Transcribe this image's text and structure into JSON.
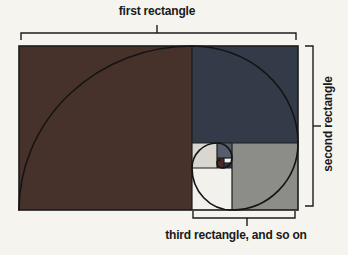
{
  "page": {
    "background": "#f5f4ef",
    "line_color": "#1c1c1c",
    "label_color": "#1a1a1a"
  },
  "labels": {
    "top": "first rectangle",
    "right": "second rectangle",
    "bottom": "third rectangle, and so on"
  },
  "figure": {
    "type": "golden-ratio-spiral-diagram",
    "outer": {
      "x": 19,
      "y": 46,
      "w": 279,
      "h": 164
    },
    "squares": [
      {
        "name": "square-1-first-maroon",
        "x": 19,
        "y": 46,
        "w": 173,
        "h": 164,
        "fill": "#47312b"
      },
      {
        "name": "square-2-second-navy",
        "x": 192,
        "y": 46,
        "w": 106,
        "h": 97,
        "fill": "#333a48"
      },
      {
        "name": "square-3-third-gray",
        "x": 232,
        "y": 143,
        "w": 66,
        "h": 67,
        "fill": "#8c8c88"
      },
      {
        "name": "square-4-white",
        "x": 192,
        "y": 168,
        "w": 40,
        "h": 42,
        "fill": "#f2f1ec"
      },
      {
        "name": "square-5-lightgray",
        "x": 192,
        "y": 143,
        "w": 25,
        "h": 25,
        "fill": "#d9d7cf"
      },
      {
        "name": "square-6-slate",
        "x": 217,
        "y": 143,
        "w": 15,
        "h": 15,
        "fill": "#565e6d"
      },
      {
        "name": "square-7-darkred",
        "x": 217,
        "y": 158,
        "w": 7,
        "h": 10,
        "fill": "#4a2a26"
      },
      {
        "name": "square-8-tiny-white",
        "x": 224,
        "y": 158,
        "w": 8,
        "h": 5,
        "fill": "#f2f1ec"
      },
      {
        "name": "square-9-tiny-navy",
        "x": 224,
        "y": 163,
        "w": 8,
        "h": 5,
        "fill": "#333a48"
      }
    ],
    "dividers": [
      "M192 46 L192 210",
      "M192 143 L298 143",
      "M232 143 L232 210",
      "M192 168 L232 168",
      "M217 143 L217 168",
      "M217 158 L232 158",
      "M224 158 L224 168",
      "M224 163 L232 163"
    ],
    "spiral_path": "M 19 210 A 173 164 0 0 1 192 46 A 106 97 0 0 1 298 143 A 66 67 0 0 1 232 210 A 40 42 0 0 1 192 168 A 25 25 0 0 1 217 143 A 15 15 0 0 1 232 158 A 10 10 0 0 1 222 168 A 5 5 0 0 1 217 163 A 3 3 0 0 1 220 160",
    "brackets": {
      "top": {
        "path": "M21 40 L21 33 L296 33 L296 40",
        "tick": "M157 33 L157 25"
      },
      "right": {
        "path": "M305 46 L313 46 L313 206 L305 206",
        "tick": "M313 126 L321 126"
      },
      "bottom": {
        "path": "M193 211 L193 218 L295 218 L295 211",
        "tick": "M247 218 L247 226"
      }
    }
  }
}
